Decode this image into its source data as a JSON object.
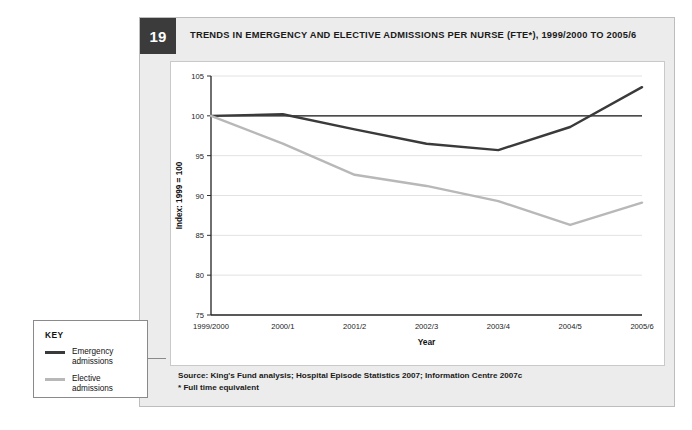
{
  "figure": {
    "number": "19",
    "title": "TRENDS IN EMERGENCY AND ELECTIVE ADMISSIONS PER NURSE (FTE*), 1999/2000 TO 2005/6"
  },
  "source": {
    "line1": "Source: King's Fund analysis; Hospital Episode Statistics 2007; Information Centre 2007c",
    "line2": "* Full time equivalent"
  },
  "legend": {
    "title": "KEY",
    "items": [
      {
        "label": "Emergency\nadmissions",
        "color": "#3a3a3a"
      },
      {
        "label": "Elective\nadmissions",
        "color": "#b8b8b8"
      }
    ]
  },
  "chart_data": {
    "type": "line",
    "title": "TRENDS IN EMERGENCY AND ELECTIVE ADMISSIONS PER NURSE (FTE*), 1999/2000 TO 2005/6",
    "xlabel": "Year",
    "ylabel": "Index: 1999 = 100",
    "categories": [
      "1999/2000",
      "2000/1",
      "2001/2",
      "2002/3",
      "2003/4",
      "2004/5",
      "2005/6"
    ],
    "ylim": [
      75,
      105
    ],
    "yticks": [
      75,
      80,
      85,
      90,
      95,
      100,
      105
    ],
    "grid": true,
    "legend_position": "outside-left",
    "reference_line": 100,
    "series": [
      {
        "name": "Emergency admissions",
        "color": "#3a3a3a",
        "values": [
          100.0,
          100.2,
          98.3,
          96.5,
          95.7,
          98.6,
          103.6
        ]
      },
      {
        "name": "Elective admissions",
        "color": "#b8b8b8",
        "values": [
          100.0,
          96.5,
          92.6,
          91.2,
          89.3,
          86.3,
          89.1
        ]
      }
    ]
  }
}
